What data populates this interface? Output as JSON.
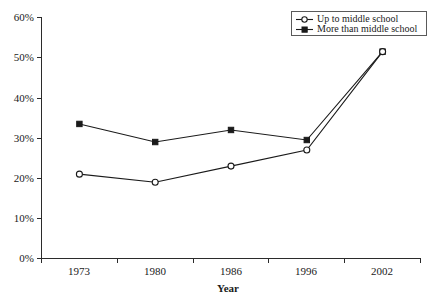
{
  "chart_data": {
    "type": "line",
    "title": "",
    "xlabel": "Year",
    "ylabel": "",
    "categories": [
      "1973",
      "1980",
      "1986",
      "1996",
      "2002"
    ],
    "series": [
      {
        "name": "Up to middle school",
        "marker": "open-circle",
        "values": [
          21,
          19,
          23,
          27,
          51.5
        ],
        "value_labels": [
          "21%",
          "19%",
          "23%",
          "27%",
          "51.5%"
        ]
      },
      {
        "name": "More than middle school",
        "marker": "filled-square",
        "values": [
          33.5,
          29,
          32,
          29.5,
          51.5
        ],
        "value_labels": [
          "33.5%",
          "29%",
          "32%",
          "29.5%",
          "51.5%"
        ]
      }
    ],
    "ylim": [
      0,
      60
    ],
    "ytick_values": [
      0,
      10,
      20,
      30,
      40,
      50,
      60
    ],
    "ytick_labels": [
      "0%",
      "10%",
      "20%",
      "30%",
      "40%",
      "50%",
      "60%"
    ],
    "grid": false,
    "legend_position": "top-right",
    "line_color": "#1a1a1a",
    "axis_color": "#2b2b2b",
    "background_color": "#ffffff"
  },
  "legend": {
    "entries": [
      {
        "label": "Up to middle school"
      },
      {
        "label": "More than middle school"
      }
    ]
  },
  "axes": {
    "x_title": "Year",
    "y_labels": [
      "60%",
      "50%",
      "40%",
      "30%",
      "20%",
      "10%",
      "0%"
    ],
    "x_labels": [
      "1973",
      "1980",
      "1986",
      "1996",
      "2002"
    ]
  }
}
